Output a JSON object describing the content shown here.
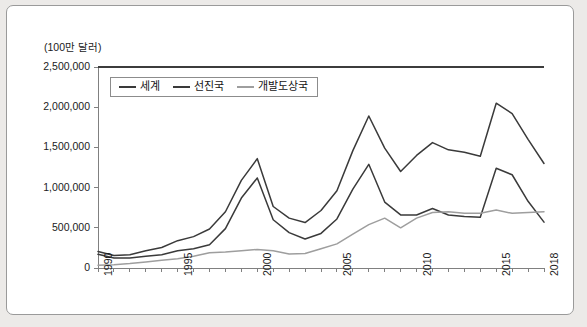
{
  "figure": {
    "unit_label": "(100만 달러)"
  },
  "legend": {
    "entries": [
      {
        "label": "세계",
        "color": "#3a3a3a"
      },
      {
        "label": "선진국",
        "color": "#3a3a3a"
      },
      {
        "label": "개발도상국",
        "color": "#9e9e9e"
      }
    ]
  },
  "chart_data": {
    "type": "line",
    "title": "",
    "xlabel": "",
    "ylabel": "(100만 달러)",
    "grid": false,
    "legend_position": "top-left",
    "xlim": [
      1990,
      2018
    ],
    "ylim": [
      0,
      2500000
    ],
    "ytick_labels": [
      "2,500,000",
      "2,000,000",
      "1,500,000",
      "1,000,000",
      "500,000",
      "0"
    ],
    "ytick_values": [
      2500000,
      2000000,
      1500000,
      1000000,
      500000,
      0
    ],
    "xtick_labels": [
      "1990",
      "1995",
      "2000",
      "2005",
      "2010",
      "2015",
      "2018"
    ],
    "xtick_values": [
      1990,
      1995,
      2000,
      2005,
      2010,
      2015,
      2018
    ],
    "x": [
      1990,
      1991,
      1992,
      1993,
      1994,
      1995,
      1996,
      1997,
      1998,
      1999,
      2000,
      2001,
      2002,
      2003,
      2004,
      2005,
      2006,
      2007,
      2008,
      2009,
      2010,
      2011,
      2012,
      2013,
      2014,
      2015,
      2016,
      2017,
      2018
    ],
    "series": [
      {
        "name": "세계",
        "color": "#3a3a3a",
        "values": [
          205000,
          155000,
          165000,
          215000,
          255000,
          340000,
          390000,
          485000,
          700000,
          1090000,
          1360000,
          765000,
          620000,
          565000,
          715000,
          960000,
          1460000,
          1890000,
          1490000,
          1200000,
          1400000,
          1560000,
          1470000,
          1440000,
          1390000,
          2050000,
          1920000,
          1600000,
          1300000
        ]
      },
      {
        "name": "선진국",
        "color": "#3a3a3a",
        "values": [
          170000,
          125000,
          125000,
          145000,
          165000,
          215000,
          240000,
          290000,
          490000,
          870000,
          1120000,
          600000,
          440000,
          360000,
          430000,
          610000,
          980000,
          1290000,
          820000,
          660000,
          660000,
          740000,
          660000,
          640000,
          630000,
          1240000,
          1160000,
          830000,
          570000
        ]
      },
      {
        "name": "개발도상국",
        "color": "#9e9e9e",
        "values": [
          35000,
          40000,
          55000,
          75000,
          95000,
          115000,
          145000,
          190000,
          200000,
          215000,
          230000,
          215000,
          175000,
          180000,
          240000,
          300000,
          420000,
          540000,
          620000,
          500000,
          620000,
          690000,
          700000,
          680000,
          680000,
          720000,
          680000,
          690000,
          700000
        ]
      }
    ]
  }
}
